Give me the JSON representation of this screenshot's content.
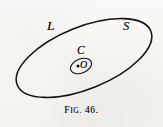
{
  "figure": {
    "caption_prefix": "F",
    "caption_prefix_small": "IG.",
    "caption_number": "46.",
    "caption_full": "FIG. 46.",
    "background_color": "#f8f7f4",
    "ink_color": "#151310"
  },
  "labels": {
    "outer_curve": "L",
    "outer_region": "S",
    "inner_curve": "C",
    "center_point": "O"
  },
  "geometry": {
    "outer_ellipse": {
      "name": "large-tilted-ellipse",
      "center_x": 84,
      "center_y": 58,
      "radius_x": 72,
      "radius_y": 31,
      "rotation_deg": -22,
      "stroke_width": 1.5
    },
    "inner_ellipse": {
      "name": "small-tilted-ellipse",
      "center_x": 81,
      "center_y": 66,
      "radius_x": 11,
      "radius_y": 7,
      "rotation_deg": -22,
      "stroke_width": 1.1
    },
    "center_dot": {
      "name": "center-point-dot",
      "x": 78,
      "y": 66,
      "radius": 1.5
    }
  }
}
